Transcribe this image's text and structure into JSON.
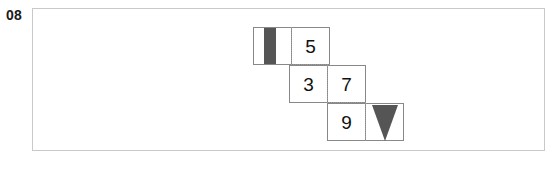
{
  "item": {
    "number": "08"
  },
  "puzzle": {
    "type": "number-staircase",
    "description": "Descending staircase of two-cell dominoes with odd numbers and shaded marker glyphs",
    "rows": [
      {
        "id": "row-1",
        "cells": [
          {
            "id": "r1c1",
            "value": "",
            "glyph": "vertical-bar",
            "glyph_color": "#555555"
          },
          {
            "id": "r1c2",
            "value": "5",
            "glyph": "",
            "glyph_color": ""
          }
        ]
      },
      {
        "id": "row-2",
        "cells": [
          {
            "id": "r2c1",
            "value": "3",
            "glyph": "",
            "glyph_color": ""
          },
          {
            "id": "r2c2",
            "value": "7",
            "glyph": "",
            "glyph_color": ""
          }
        ]
      },
      {
        "id": "row-3",
        "cells": [
          {
            "id": "r3c1",
            "value": "9",
            "glyph": "",
            "glyph_color": ""
          },
          {
            "id": "r3c2",
            "value": "",
            "glyph": "down-triangle",
            "glyph_color": "#555555"
          }
        ]
      }
    ]
  },
  "clipped_row": {
    "visible_fragment": "· ·  ·  ·  ·  ·  ·  ·"
  },
  "colors": {
    "frame_border": "#c9c9c9",
    "cell_border": "#888888",
    "grid_dotted": "#9a9a9a",
    "glyph_fill": "#555555",
    "text": "#111111",
    "background": "#ffffff"
  }
}
